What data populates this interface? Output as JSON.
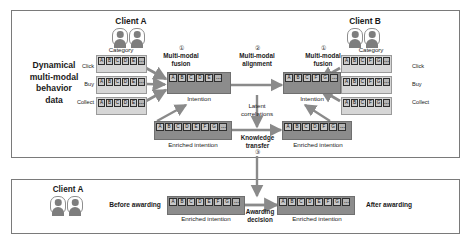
{
  "figure": {
    "panels": {
      "top": {
        "name": "multi-modal behavior modelling panel"
      },
      "bottom": {
        "name": "awarding decision panel"
      }
    }
  },
  "left_label": {
    "line1": "Dynamical",
    "line2": "multi-modal",
    "line3": "behavior",
    "line4": "data"
  },
  "clients": {
    "a_top": "Client A",
    "b_top": "Client B",
    "a_bottom": "Client A"
  },
  "behavior_rows": {
    "left": [
      "Click",
      "Buy",
      "Collect"
    ],
    "right": [
      "Click",
      "Buy",
      "Collect"
    ]
  },
  "category_label": {
    "left": "Category",
    "right": "Category"
  },
  "steps": {
    "fusion_left_num": "①",
    "fusion_left": "Multi-modal\nfusion",
    "fusion_left_l1": "Multi-modal",
    "fusion_left_l2": "fusion",
    "alignment_num": "②",
    "alignment_l1": "Multi-modal",
    "alignment_l2": "alignment",
    "fusion_right_num": "①",
    "fusion_right_l1": "Multi-modal",
    "fusion_right_l2": "fusion",
    "latent_l1": "Latent",
    "latent_l2": "correlations",
    "knowledge_l1": "Knowledge",
    "knowledge_l2": "transfer",
    "knowledge_num": "③",
    "awarding_l1": "Awarding",
    "awarding_l2": "decision"
  },
  "intention_labels": {
    "left": "Intention",
    "right": "Intention",
    "enriched_left": "Enriched intention",
    "enriched_right": "Enriched intention",
    "enriched_before": "Enriched intention",
    "enriched_after": "Enriched intention"
  },
  "bottom_labels": {
    "before": "Before awarding",
    "after": "After awarding"
  },
  "tokens": {
    "client_a_category": [
      "A",
      "B",
      "C",
      "D",
      "E",
      "⋯"
    ],
    "client_b_category": [
      "A",
      "B",
      "C",
      "F",
      "G",
      "⋯"
    ],
    "intention_left": [
      "A",
      "B",
      "C",
      "D",
      "E",
      "⋯"
    ],
    "intention_right": [
      "A",
      "B",
      "C",
      "F",
      "G",
      "⋯"
    ],
    "enriched_left": [
      "A",
      "B",
      "C",
      "D",
      "E",
      "F",
      "G",
      "⋯"
    ],
    "enriched_right": [
      "A",
      "B",
      "C",
      "D",
      "F",
      "G",
      "⋯"
    ],
    "before_awarding": [
      "A",
      "B",
      "C",
      "D",
      "E",
      "F",
      "G",
      "⋯"
    ],
    "after_awarding": [
      "A",
      "B",
      "C",
      "D",
      "E",
      "F",
      "G",
      "⋯"
    ]
  },
  "colors": {
    "panel_border": "#7a7a7a",
    "category_fill": "#d6d6d6",
    "intention_fill": "#8c8c8c",
    "token_fill": "#c9c9c9",
    "arrow_fill": "#8a8a8a",
    "text": "#1a1a1a"
  }
}
